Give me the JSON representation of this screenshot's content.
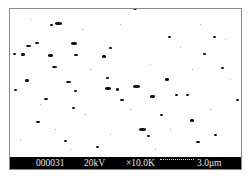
{
  "info_bar": {
    "image_number": "000031",
    "voltage": "20kV",
    "magnification": "×10.0K",
    "scale_bar": "3.0μm"
  },
  "colors": {
    "background": "#ffffff",
    "particles": "#111111",
    "info_bar_bg": "#000000",
    "info_bar_text": "#e6e6e6"
  }
}
